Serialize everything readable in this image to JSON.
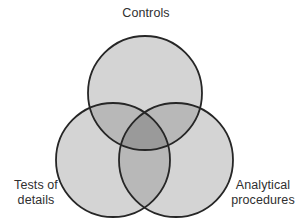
{
  "figure": {
    "width": 301,
    "height": 223,
    "background_color": "#ffffff"
  },
  "labels": {
    "top": "Controls",
    "bottom_left": "Tests of\ndetails",
    "bottom_right": "Analytical\nprocedures"
  },
  "chart_data": {
    "type": "diagram",
    "diagram_type": "venn",
    "title": "",
    "set_count": 3,
    "sets": [
      {
        "id": "controls",
        "label": "Controls",
        "position": "top",
        "center_x": 145,
        "center_y": 93,
        "radius": 57,
        "fill": "#d4d4d4",
        "stroke": "#262626"
      },
      {
        "id": "tests-of-details",
        "label": "Tests of details",
        "position": "bottom-left",
        "center_x": 113,
        "center_y": 160,
        "radius": 57,
        "fill": "#d4d4d4",
        "stroke": "#262626"
      },
      {
        "id": "analytical-procedures",
        "label": "Analytical procedures",
        "position": "bottom-right",
        "center_x": 176,
        "center_y": 160,
        "radius": 57,
        "fill": "#d4d4d4",
        "stroke": "#262626"
      }
    ],
    "overlap_shading": {
      "single": "#d4d4d4",
      "double": "#b8b8b8",
      "triple": "#9a9a9a"
    },
    "stroke_width": 1.8,
    "text_color": "#2f2f2f",
    "legend": "none",
    "grid": false
  }
}
